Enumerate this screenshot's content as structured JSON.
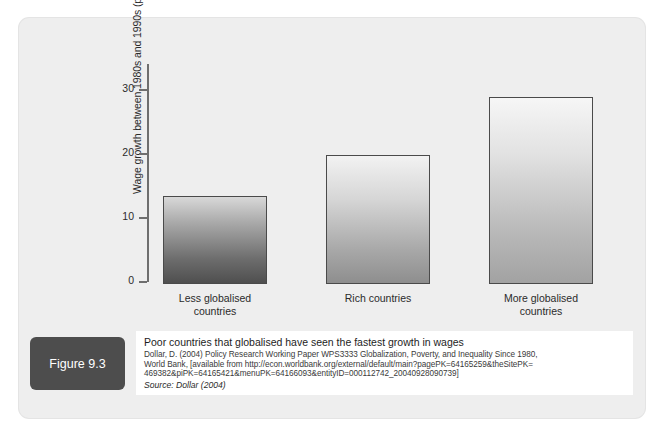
{
  "figure": {
    "badge_label": "Figure 9.3",
    "caption_title": "Poor countries that globalised have seen the fastest growth in wages",
    "reference_line_1": "Dollar, D. (2004) Policy Research Working Paper WPS3333 Globalization, Poverty, and Inequality Since 1980,",
    "reference_line_2": "World Bank, [available from http://econ.worldbank.org/external/default/main?pagePK=64165259&theSitePK=",
    "reference_line_3": "469382&piPK=64165421&menuPK=64166093&entityID=000112742_20040928090739]",
    "source_line": "Source: Dollar (2004)"
  },
  "colors": {
    "panel_background": "#eeeeee",
    "badge_background": "#4d4d4d",
    "caption_background": "#ffffff",
    "axis": "#6e6e6e",
    "bar_border": "#4a4a4a"
  },
  "chart_data": {
    "type": "bar",
    "title": "",
    "xlabel": "",
    "ylabel": "Wage growth between 1980s and 1990s (percent)",
    "categories": [
      "Less globalised countries",
      "Rich countries",
      "More globalised countries"
    ],
    "category_lines": [
      [
        "Less globalised",
        "countries"
      ],
      [
        "Rich countries",
        ""
      ],
      [
        "More globalised",
        "countries"
      ]
    ],
    "values": [
      13.8,
      20.1,
      29.2
    ],
    "ylim": [
      0,
      34
    ],
    "yticks": [
      0,
      10,
      20,
      30
    ],
    "ytick_labels": [
      "0",
      "10",
      "20",
      "30"
    ],
    "grid": false,
    "legend": false,
    "bar_fills": [
      "dark-gradient",
      "mid-gradient",
      "light-gradient"
    ]
  }
}
